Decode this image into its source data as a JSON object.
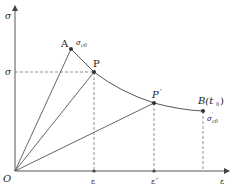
{
  "diagram": {
    "type": "stress-strain relaxation diagram",
    "axes": {
      "y_label": "σ",
      "x_label": "ε",
      "origin_label": "O"
    },
    "points": {
      "A": {
        "label": "A",
        "annotation_main": "σ",
        "annotation_sub": "c0"
      },
      "P": {
        "label": "P"
      },
      "P_prime": {
        "label": "P",
        "prime": "′"
      },
      "B": {
        "label": "B(t",
        "sub": "0",
        "close": ")",
        "annotation_main": "σ",
        "annotation_prime": "′",
        "annotation_sub": "c0"
      }
    },
    "y_ticks": [
      {
        "label": "σ"
      }
    ],
    "x_ticks": [
      {
        "label": "ε"
      },
      {
        "label": "ε",
        "sub": "r"
      }
    ],
    "colors": {
      "line": "#555555",
      "dashed": "#777777",
      "point": "#333333"
    }
  }
}
